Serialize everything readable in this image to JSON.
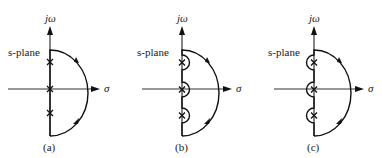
{
  "figure": {
    "plane_label": "s-plane",
    "imag_axis_label": "jω",
    "real_axis_label": "σ",
    "panels": [
      {
        "id": "a",
        "caption": "(a)",
        "contour": "Nyquist contour passing directly through poles on the jω axis"
      },
      {
        "id": "b",
        "caption": "(b)",
        "contour": "Nyquist contour detouring to the right around jω-axis poles"
      },
      {
        "id": "c",
        "caption": "(c)",
        "contour": "Nyquist contour detouring to the left around jω-axis poles"
      }
    ],
    "pole_marker": "×",
    "poles_per_panel": 3
  }
}
